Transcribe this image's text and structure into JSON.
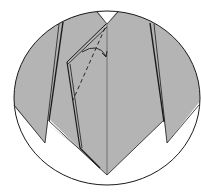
{
  "diagram": {
    "colors": {
      "paper": "#b4b4b4",
      "background": "#ffffff",
      "line": "#1a1a1a"
    },
    "elements": {
      "frame": "circular-detail-frame",
      "fold_line": "valley-fold-dashed",
      "arrow": "fold-direction-arrow"
    }
  }
}
